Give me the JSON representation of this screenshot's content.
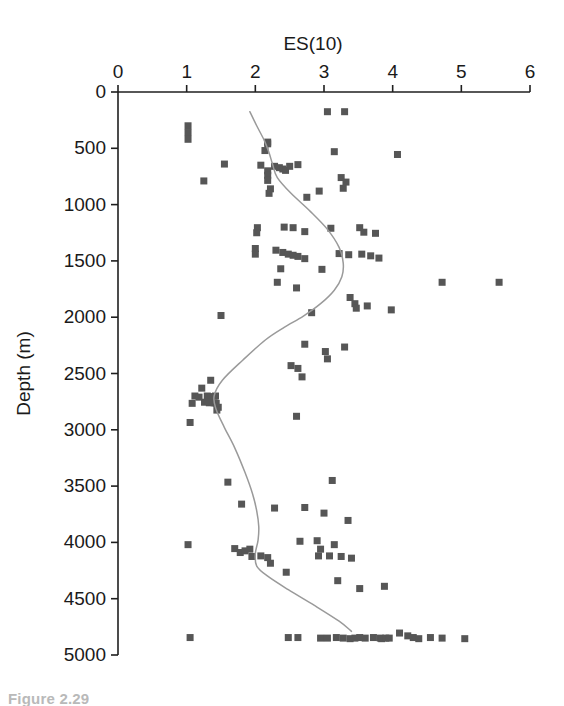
{
  "figure": {
    "caption": "Figure 2.29",
    "marker_color": "#565656",
    "curve_color": "#9a9a9a",
    "axis_color": "#1f1f1f"
  },
  "chart_data": {
    "type": "scatter",
    "title": "ES(10)",
    "xlabel": "ES(10)",
    "ylabel": "Depth (m)",
    "xlim": [
      0,
      6
    ],
    "ylim": [
      0,
      5000
    ],
    "y_inverted": true,
    "grid": false,
    "legend": null,
    "xticks": [
      0,
      1,
      2,
      3,
      4,
      5,
      6
    ],
    "xtick_labels": [
      "0",
      "1",
      "2",
      "3",
      "4",
      "5",
      "6"
    ],
    "yticks": [
      0,
      500,
      1000,
      1500,
      2000,
      2500,
      3000,
      3500,
      4000,
      4500,
      5000
    ],
    "ytick_labels": [
      "0",
      "500",
      "1000",
      "1500",
      "2000",
      "2500",
      "3000",
      "3500",
      "4000",
      "4500",
      "5000"
    ],
    "series": [
      {
        "name": "ES(10) samples",
        "marker": "square",
        "x": [
          3.05,
          3.3,
          1.02,
          1.02,
          1.02,
          2.18,
          2.18,
          2.14,
          3.15,
          4.07,
          1.55,
          2.08,
          2.28,
          2.35,
          2.4,
          2.44,
          2.5,
          2.62,
          2.18,
          2.18,
          2.18,
          1.25,
          3.25,
          3.32,
          3.28,
          2.22,
          2.2,
          2.93,
          2.75,
          2.03,
          2.02,
          2.42,
          2.55,
          2.72,
          3.1,
          3.52,
          3.58,
          3.75,
          2.0,
          2.0,
          2.3,
          2.4,
          2.48,
          2.55,
          2.62,
          2.72,
          3.22,
          3.36,
          3.55,
          3.68,
          3.8,
          2.37,
          2.97,
          4.72,
          5.55,
          2.32,
          2.6,
          3.38,
          3.45,
          3.47,
          3.63,
          3.98,
          2.82,
          1.5,
          2.72,
          3.02,
          3.3,
          1.22,
          1.12,
          1.18,
          1.3,
          1.36,
          1.42,
          1.08,
          1.26,
          1.33,
          1.4,
          1.43,
          1.46,
          1.44,
          2.52,
          2.62,
          3.05,
          1.35,
          2.68,
          1.05,
          2.6,
          1.6,
          3.12,
          1.8,
          2.28,
          2.72,
          3.0,
          3.35,
          2.65,
          2.9,
          2.95,
          3.15,
          1.02,
          1.7,
          1.78,
          1.85,
          1.92,
          1.95,
          2.08,
          2.18,
          2.92,
          3.08,
          3.25,
          3.4,
          2.22,
          2.45,
          3.2,
          3.52,
          3.88,
          1.05,
          2.48,
          2.62,
          2.95,
          3.05,
          3.18,
          3.28,
          3.38,
          3.45,
          3.52,
          3.6,
          3.72,
          3.82,
          3.84,
          3.9,
          3.95,
          4.1,
          4.22,
          4.3,
          4.38,
          4.55,
          4.72,
          5.05
        ],
        "y": [
          175,
          175,
          300,
          360,
          420,
          445,
          460,
          520,
          530,
          555,
          640,
          650,
          660,
          672,
          684,
          696,
          660,
          645,
          700,
          740,
          785,
          790,
          760,
          800,
          855,
          860,
          900,
          880,
          935,
          1205,
          1250,
          1200,
          1205,
          1240,
          1210,
          1205,
          1245,
          1255,
          1390,
          1440,
          1405,
          1425,
          1440,
          1450,
          1460,
          1480,
          1435,
          1445,
          1440,
          1455,
          1475,
          1570,
          1575,
          1690,
          1690,
          1690,
          1740,
          1825,
          1880,
          1920,
          1900,
          1935,
          1960,
          1985,
          2240,
          2305,
          2265,
          2630,
          2700,
          2710,
          2700,
          2705,
          2700,
          2765,
          2755,
          2760,
          2760,
          2765,
          2800,
          2825,
          2430,
          2455,
          2370,
          2560,
          2530,
          2935,
          2880,
          3465,
          3450,
          3660,
          3695,
          3690,
          3740,
          3805,
          3990,
          3985,
          4060,
          4020,
          4020,
          4055,
          4090,
          4075,
          4060,
          4125,
          4120,
          4135,
          4120,
          4120,
          4125,
          4140,
          4185,
          4265,
          4340,
          4410,
          4390,
          4845,
          4845,
          4845,
          4850,
          4850,
          4845,
          4850,
          4855,
          4850,
          4845,
          4850,
          4845,
          4850,
          4855,
          4850,
          4850,
          4805,
          4830,
          4845,
          4855,
          4845,
          4850,
          4855
        ],
        "color": "#565656"
      }
    ],
    "trend_curve": {
      "name": "smoothed mean",
      "color": "#9a9a9a",
      "x": [
        1.92,
        2.02,
        2.13,
        2.2,
        2.25,
        2.32,
        2.52,
        2.8,
        3.05,
        3.22,
        3.28,
        3.26,
        3.15,
        2.95,
        2.7,
        2.42,
        2.15,
        1.82,
        1.52,
        1.4,
        1.43,
        1.55,
        1.7,
        1.85,
        1.96,
        2.02,
        2.05,
        2.04,
        2.0,
        2.02,
        2.18,
        2.48,
        2.86,
        3.22,
        3.4
      ],
      "y": [
        175,
        300,
        430,
        540,
        640,
        760,
        900,
        1060,
        1220,
        1380,
        1520,
        1640,
        1760,
        1880,
        1990,
        2090,
        2200,
        2380,
        2560,
        2700,
        2820,
        2980,
        3160,
        3380,
        3570,
        3720,
        3860,
        3980,
        4100,
        4210,
        4300,
        4420,
        4560,
        4700,
        4790
      ]
    }
  }
}
